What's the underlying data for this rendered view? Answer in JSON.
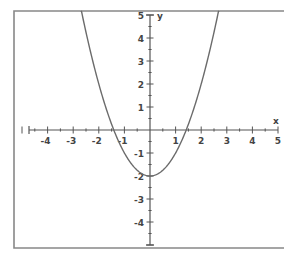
{
  "chart_data": {
    "type": "line",
    "title": "",
    "function": "y = x^2 - 2",
    "xlabel": "x",
    "ylabel": "y",
    "xlim": [
      -5,
      5
    ],
    "ylim": [
      -5,
      5
    ],
    "grid": false,
    "x_ticks": [
      -4,
      -3,
      -2,
      -1,
      1,
      2,
      3,
      4,
      5
    ],
    "y_ticks": [
      5,
      4,
      3,
      2,
      1,
      -1,
      -2,
      -3,
      -4
    ],
    "minor_ticks_per_unit": 2,
    "series": [
      {
        "name": "parabola",
        "x": [
          -2.65,
          -2.5,
          -2,
          -1.5,
          -1.41,
          -1,
          -0.5,
          0,
          0.5,
          1,
          1.41,
          1.5,
          2,
          2.5,
          2.65
        ],
        "values": [
          5.02,
          4.25,
          2,
          0.25,
          0,
          -1,
          -1.75,
          -2,
          -1.75,
          -1,
          0,
          0.25,
          2,
          4.25,
          5.02
        ]
      }
    ],
    "vertex": [
      0,
      -2
    ],
    "x_intercepts": [
      -1.41,
      1.41
    ],
    "y_intercept": -2
  },
  "style": {
    "curve_color": "#6b6b6b",
    "axis_color": "#555555",
    "frame_color": "#888888",
    "background": "#ffffff"
  },
  "layout": {
    "origin_px": [
      150,
      130
    ],
    "px_per_unit_x": 25.6,
    "px_per_unit_y": 23,
    "frame": {
      "left": 14,
      "top": 11,
      "bottom": 248
    }
  }
}
